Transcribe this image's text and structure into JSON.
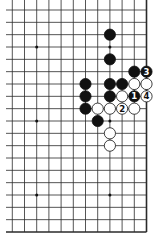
{
  "diagram": {
    "type": "go-board-section",
    "grid": {
      "columns": 12,
      "rows": 19,
      "right_edge": true,
      "bottom_edge": true,
      "top_edge": false,
      "left_edge": false
    },
    "star_points": [
      {
        "col": 2,
        "row": 3
      },
      {
        "col": 8,
        "row": 3
      },
      {
        "col": 2,
        "row": 9
      },
      {
        "col": 8,
        "row": 9
      },
      {
        "col": 2,
        "row": 15
      },
      {
        "col": 8,
        "row": 15
      }
    ],
    "stones": [
      {
        "color": "black",
        "col": 8,
        "row": 2,
        "label": ""
      },
      {
        "color": "black",
        "col": 8,
        "row": 4,
        "label": ""
      },
      {
        "color": "black",
        "col": 10,
        "row": 5,
        "label": ""
      },
      {
        "color": "black",
        "col": 11,
        "row": 5,
        "label": "3"
      },
      {
        "color": "black",
        "col": 6,
        "row": 6,
        "label": ""
      },
      {
        "color": "black",
        "col": 8,
        "row": 6,
        "label": ""
      },
      {
        "color": "black",
        "col": 9,
        "row": 6,
        "label": ""
      },
      {
        "color": "white",
        "col": 10,
        "row": 6,
        "label": ""
      },
      {
        "color": "white",
        "col": 11,
        "row": 6,
        "label": ""
      },
      {
        "color": "black",
        "col": 6,
        "row": 7,
        "label": ""
      },
      {
        "color": "black",
        "col": 8,
        "row": 7,
        "label": ""
      },
      {
        "color": "white",
        "col": 9,
        "row": 7,
        "label": ""
      },
      {
        "color": "black",
        "col": 10,
        "row": 7,
        "label": "1"
      },
      {
        "color": "white",
        "col": 11,
        "row": 7,
        "label": "4"
      },
      {
        "color": "black",
        "col": 6,
        "row": 8,
        "label": ""
      },
      {
        "color": "white",
        "col": 7,
        "row": 8,
        "label": ""
      },
      {
        "color": "white",
        "col": 8,
        "row": 8,
        "label": ""
      },
      {
        "color": "white",
        "col": 9,
        "row": 8,
        "label": "2"
      },
      {
        "color": "white",
        "col": 10,
        "row": 8,
        "label": ""
      },
      {
        "color": "black",
        "col": 7,
        "row": 9,
        "label": ""
      },
      {
        "color": "white",
        "col": 8,
        "row": 10,
        "label": ""
      },
      {
        "color": "white",
        "col": 8,
        "row": 11,
        "label": ""
      }
    ],
    "colors": {
      "line": "#2a2a2a",
      "black_stone": "#111111",
      "white_stone": "#ffffff",
      "background": "#ffffff"
    }
  }
}
